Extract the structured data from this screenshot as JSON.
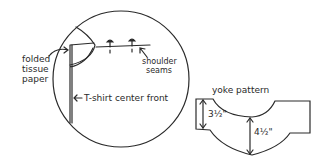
{
  "diagram": {
    "left_panel": {
      "labels": {
        "folded_tissue_line1": "folded",
        "folded_tissue_line2": "tissue",
        "folded_tissue_line3": "paper",
        "shoulder_line1": "shoulder",
        "shoulder_line2": "seams",
        "center_front": "T-shirt center front"
      }
    },
    "right_panel": {
      "title": "yoke pattern",
      "dim_left": "3½\"",
      "dim_center": "4½\""
    },
    "colors": {
      "ink": "#2a2a2a",
      "background": "#ffffff"
    }
  }
}
